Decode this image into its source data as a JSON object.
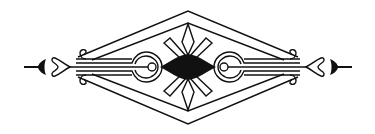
{
  "ornament": {
    "name": "decorative diamond divider",
    "colors": {
      "ink": "#111111",
      "paper": "#ffffff"
    },
    "parts": [
      "outer-diamond-frame",
      "inner-diamond-frame",
      "center-filled-diamond",
      "radiating-petals",
      "left-scroll-arm",
      "right-scroll-arm",
      "left-arrowhead",
      "right-arrowhead"
    ]
  }
}
